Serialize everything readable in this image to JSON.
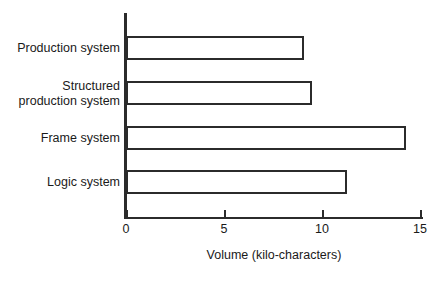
{
  "chart_data": {
    "type": "bar",
    "orientation": "horizontal",
    "title": "",
    "xlabel": "Volume (kilo-characters)",
    "ylabel": "",
    "categories": [
      "Production system",
      "Structured\nproduction system",
      "Frame system",
      "Logic system"
    ],
    "values": [
      9.1,
      9.5,
      14.3,
      11.3
    ],
    "xlim": [
      0,
      15
    ],
    "xticks": [
      0,
      5,
      10,
      15
    ],
    "xtick_labels": [
      "0",
      "5",
      "10",
      "15"
    ],
    "grid": false,
    "legend": false,
    "bar_fill": "#ffffff",
    "bar_edge_color": "#2b2b2b",
    "background": "#ffffff"
  },
  "axis": {
    "x_title": "Volume (kilo-characters)"
  }
}
